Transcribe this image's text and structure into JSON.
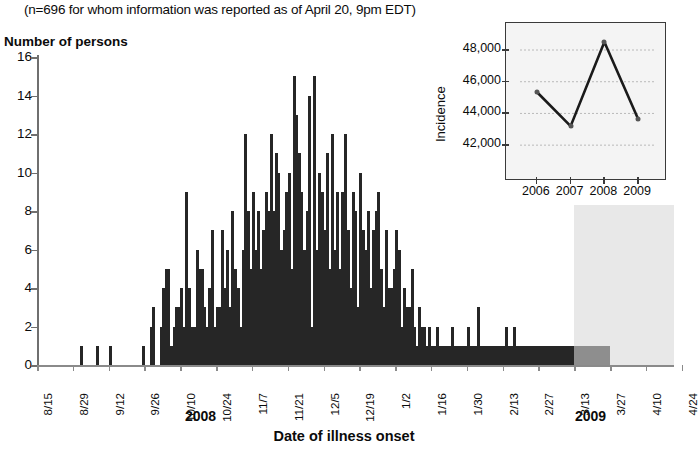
{
  "subtitle": "(n=696 for whom information was reported as of April 20, 9pm EDT)",
  "y_axis_title": "Number of persons",
  "x_axis_title": "Date of illness onset",
  "year_labels": [
    {
      "text": "2008",
      "x": 185
    },
    {
      "text": "2009",
      "x": 575
    }
  ],
  "colors": {
    "bar": "#262626",
    "bar_incomplete": "#8e8e8e",
    "shade": "#e8e8e8",
    "axis": "#6f6f6f",
    "inset_line": "#1a1a1a",
    "inset_bg": "#f4f4f4"
  },
  "chart_data": {
    "type": "bar",
    "title": "",
    "subtitle": "(n=696 for whom information was reported as of April 20, 9pm EDT)",
    "xlabel": "Date of illness onset",
    "ylabel": "Number of persons",
    "ylim": [
      0,
      16
    ],
    "ytick_values": [
      0,
      2,
      4,
      6,
      8,
      10,
      12,
      14,
      16
    ],
    "grid": false,
    "legend": "none",
    "xtick_labels": [
      "8/15",
      "8/29",
      "9/12",
      "9/26",
      "10/10",
      "10/24",
      "11/7",
      "11/21",
      "12/5",
      "12/19",
      "1/2",
      "1/16",
      "1/30",
      "2/13",
      "2/27",
      "3/13",
      "3/27",
      "4/10",
      "4/24"
    ],
    "xtick_interval_days": 14,
    "start_date": "8/15",
    "shaded_region": {
      "note": "Cases with onset in this period may not yet be reported",
      "start_label": "3/13",
      "end_label": "4/24"
    },
    "values": [
      0,
      0,
      0,
      0,
      0,
      0,
      0,
      0,
      0,
      0,
      0,
      0,
      0,
      0,
      0,
      0,
      0,
      1,
      0,
      0,
      0,
      0,
      0,
      1,
      0,
      0,
      0,
      0,
      1,
      0,
      0,
      0,
      0,
      0,
      0,
      0,
      0,
      0,
      0,
      0,
      0,
      1,
      0,
      0,
      2,
      3,
      0,
      0,
      2,
      4,
      5,
      5,
      1,
      2,
      3,
      3,
      4,
      2,
      9,
      4,
      2,
      2,
      6,
      5,
      5,
      3,
      2,
      4,
      7,
      2,
      3,
      3,
      7,
      4,
      6,
      3,
      8,
      5,
      4,
      2,
      6,
      12,
      8,
      5,
      9,
      6,
      8,
      5,
      7,
      9,
      8,
      12,
      8,
      11,
      10,
      6,
      7,
      9,
      10,
      5,
      15,
      13,
      11,
      9,
      6,
      8,
      14,
      2,
      15,
      6,
      10,
      9,
      7,
      11,
      5,
      12,
      6,
      9,
      5,
      9,
      12,
      7,
      4,
      9,
      8,
      3,
      10,
      7,
      6,
      8,
      4,
      7,
      8,
      9,
      5,
      3,
      7,
      4,
      4,
      5,
      7,
      6,
      2,
      4,
      3,
      3,
      5,
      2,
      1,
      3,
      2,
      2,
      1,
      2,
      1,
      1,
      2,
      1,
      1,
      1,
      1,
      1,
      2,
      1,
      1,
      1,
      1,
      1,
      2,
      1,
      1,
      1,
      3,
      1,
      1,
      1,
      1,
      1,
      1,
      1,
      1,
      1,
      1,
      2,
      1,
      1,
      2,
      1,
      1,
      1,
      1,
      1,
      1,
      1,
      1,
      1,
      1,
      1,
      1,
      1,
      1,
      1,
      1,
      1,
      1,
      1,
      1,
      1,
      1,
      1,
      1,
      1,
      1,
      1,
      1,
      1,
      1,
      1,
      1,
      1,
      1,
      1,
      1,
      1,
      0,
      0,
      0,
      0,
      0,
      0,
      0,
      0,
      0,
      0,
      0,
      0,
      0,
      0,
      0,
      0,
      0,
      0,
      0,
      0,
      0,
      0,
      0,
      0,
      0
    ]
  },
  "inset": {
    "chart_data": {
      "type": "line",
      "title": "",
      "xlabel": "",
      "ylabel": "Incidence",
      "categories": [
        "2006",
        "2007",
        "2008",
        "2009"
      ],
      "values": [
        45350,
        43200,
        48500,
        43650
      ],
      "ylim": [
        41000,
        49200
      ],
      "ytick_values": [
        42000,
        44000,
        46000,
        48000
      ],
      "ytick_labels": [
        "42,000",
        "44,000",
        "46,000",
        "48,000"
      ],
      "grid": true,
      "legend": "none",
      "markers": true
    }
  }
}
